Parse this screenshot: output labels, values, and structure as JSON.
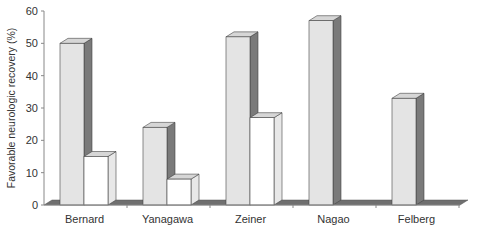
{
  "chart_data": {
    "type": "bar",
    "style": "3d-grouped",
    "title": "",
    "xlabel": "",
    "ylabel": "Favorable neurologic recovery (%)",
    "ylim": [
      0,
      60
    ],
    "yticks": [
      0,
      10,
      20,
      30,
      40,
      50,
      60
    ],
    "categories": [
      "Bernard",
      "Yanagawa",
      "Zeiner",
      "Nagao",
      "Felberg"
    ],
    "series": [
      {
        "name": "Hypothermia",
        "color": "#e4e4e4",
        "values": [
          50,
          24,
          52,
          57,
          33
        ]
      },
      {
        "name": "Normothermia",
        "color": "#ffffff",
        "values": [
          15,
          8,
          27,
          null,
          null
        ]
      }
    ],
    "grid": false,
    "legend": "none",
    "colors": {
      "floor": "#6f6f6f",
      "side_dark": "#7a7a7a",
      "side_light": "#e8e8e8",
      "top": "#d6d6d6",
      "axis": "#888888"
    }
  }
}
